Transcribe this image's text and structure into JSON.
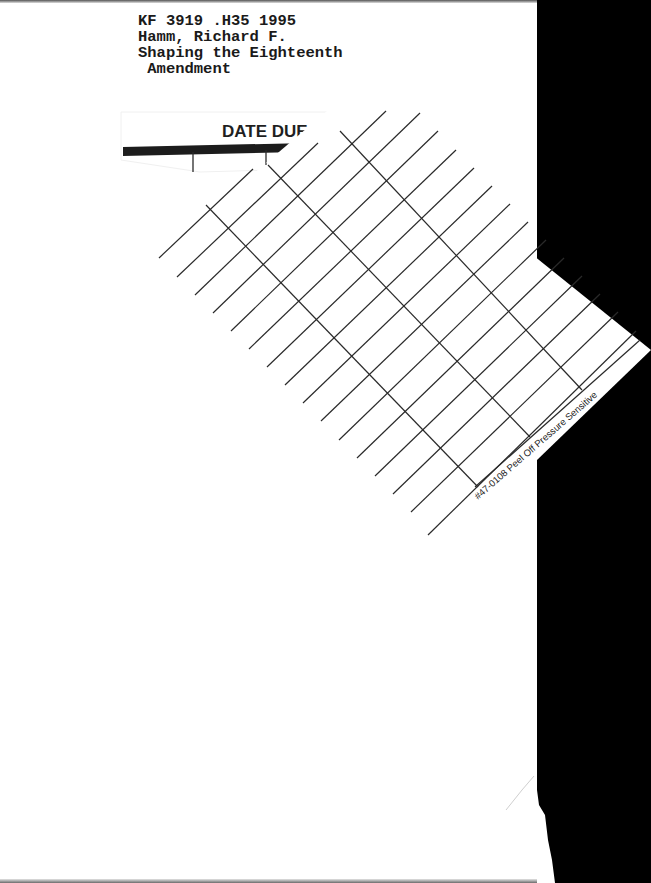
{
  "catalog_label": {
    "call_number": "KF 3919 .H35 1995",
    "author": "Hamm, Richard F.",
    "title_line1": "Shaping the Eighteenth",
    "title_line2": " Amendment"
  },
  "date_due_slip": {
    "heading": "DATE DUE",
    "footer_text": "#47-0108 Peel Off Pressure Sensitive",
    "line_color": "#2a2a2a",
    "header_bar_color": "#1c1c1c"
  },
  "scan_background": {
    "page_color": "#ffffff",
    "edge_color": "#000000"
  }
}
